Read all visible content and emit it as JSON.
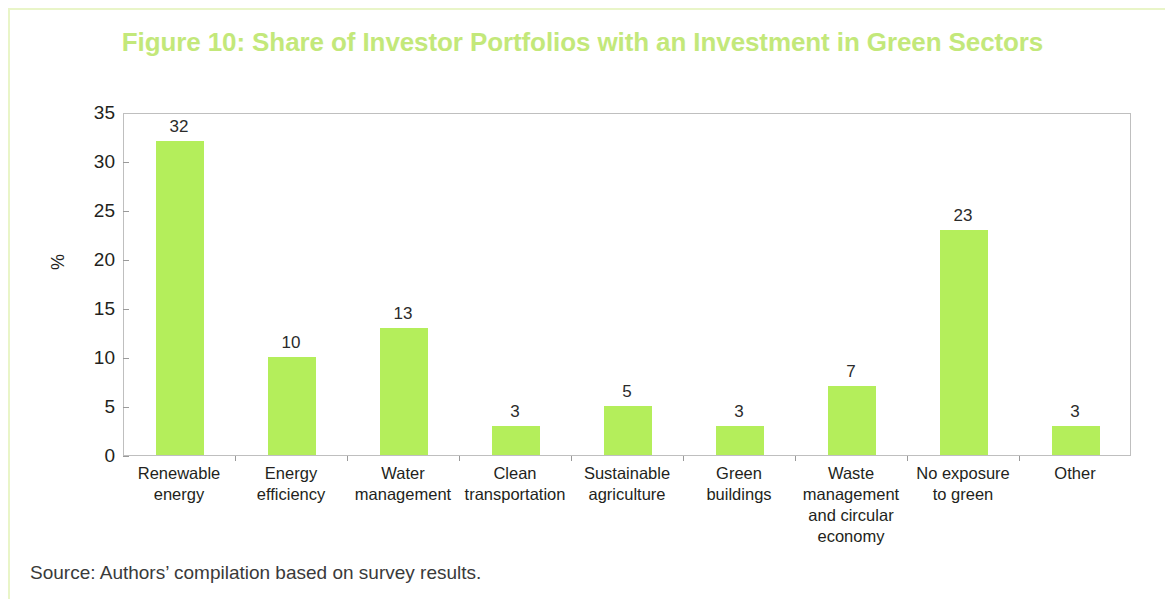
{
  "figure": {
    "title": "Figure 10: Share of Investor Portfolios with an Investment in Green Sectors",
    "source_note": "Source: Authors’ compilation based on survey results.",
    "title_color": "#c3e87a",
    "bar_color": "#b4ee5b",
    "frame_color": "#e9f5c8"
  },
  "chart_data": {
    "type": "bar",
    "title": "Figure 10: Share of Investor Portfolios with an Investment in Green Sectors",
    "categories": [
      "Renewable energy",
      "Energy efficiency",
      "Water management",
      "Clean transportation",
      "Sustainable agriculture",
      "Green buildings",
      "Waste management and circular economy",
      "No exposure to green",
      "Other"
    ],
    "category_lines": [
      [
        "Renewable",
        "energy"
      ],
      [
        "Energy",
        "efficiency"
      ],
      [
        "Water",
        "management"
      ],
      [
        "Clean",
        "transportation"
      ],
      [
        "Sustainable",
        "agriculture"
      ],
      [
        "Green",
        "buildings"
      ],
      [
        "Waste",
        "management",
        "and circular",
        "economy"
      ],
      [
        "No exposure",
        "to green"
      ],
      [
        "Other"
      ]
    ],
    "values": [
      32,
      10,
      13,
      3,
      5,
      3,
      7,
      23,
      3
    ],
    "value_labels": [
      "32",
      "10",
      "13",
      "3",
      "5",
      "3",
      "7",
      "23",
      "3"
    ],
    "xlabel": "",
    "ylabel": "%",
    "ylim": [
      0,
      35
    ],
    "yticks": [
      0,
      5,
      10,
      15,
      20,
      25,
      30,
      35
    ],
    "ytick_labels": [
      "0",
      "5",
      "10",
      "15",
      "20",
      "25",
      "30",
      "35"
    ],
    "grid": false,
    "legend": false
  }
}
